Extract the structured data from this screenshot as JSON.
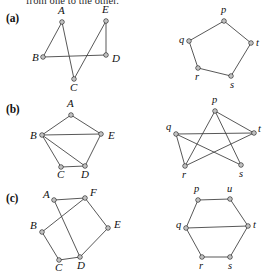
{
  "document": {
    "clipped_text": "from one to the other.",
    "panels": [
      {
        "id": "a",
        "label": "(a)"
      },
      {
        "id": "b",
        "label": "(b)"
      },
      {
        "id": "c",
        "label": "(c)"
      }
    ]
  },
  "figure": {
    "node_style": "open-circle",
    "edge_color": "#3a3a3a",
    "node_fill": "#ffffff",
    "node_stroke": "#2b2b2b",
    "graphs": [
      {
        "panel": "a",
        "side": "left",
        "name": "graph-a-left",
        "vertices": [
          {
            "id": "A",
            "label": "A",
            "x": 62,
            "y": 22,
            "lx": 58,
            "ly": 14
          },
          {
            "id": "E",
            "label": "E",
            "x": 106,
            "y": 21,
            "lx": 102,
            "ly": 13
          },
          {
            "id": "B",
            "label": "B",
            "x": 43,
            "y": 57,
            "lx": 32,
            "ly": 61
          },
          {
            "id": "D",
            "label": "D",
            "x": 106,
            "y": 55,
            "lx": 112,
            "ly": 62
          },
          {
            "id": "C",
            "label": "C",
            "x": 74,
            "y": 79,
            "lx": 70,
            "ly": 91
          }
        ],
        "edges": [
          [
            "A",
            "B"
          ],
          [
            "A",
            "C"
          ],
          [
            "B",
            "D"
          ],
          [
            "C",
            "E"
          ],
          [
            "E",
            "D"
          ]
        ]
      },
      {
        "panel": "a",
        "side": "right",
        "name": "graph-a-right",
        "vertices": [
          {
            "id": "p",
            "label": "p",
            "x": 224,
            "y": 21,
            "lx": 221,
            "ly": 13
          },
          {
            "id": "q",
            "label": "q",
            "x": 189,
            "y": 41,
            "lx": 179,
            "ly": 43
          },
          {
            "id": "t",
            "label": "t",
            "x": 251,
            "y": 43,
            "lx": 256,
            "ly": 46
          },
          {
            "id": "r",
            "label": "r",
            "x": 198,
            "y": 68,
            "lx": 195,
            "ly": 80
          },
          {
            "id": "s",
            "label": "s",
            "x": 231,
            "y": 76,
            "lx": 230,
            "ly": 88
          }
        ],
        "edges": [
          [
            "p",
            "q"
          ],
          [
            "q",
            "r"
          ],
          [
            "r",
            "s"
          ],
          [
            "s",
            "t"
          ],
          [
            "t",
            "p"
          ]
        ]
      },
      {
        "panel": "b",
        "side": "left",
        "name": "graph-b-left",
        "vertices": [
          {
            "id": "A",
            "label": "A",
            "x": 71,
            "y": 115,
            "lx": 67,
            "ly": 107
          },
          {
            "id": "B",
            "label": "B",
            "x": 42,
            "y": 135,
            "lx": 30,
            "ly": 139
          },
          {
            "id": "E",
            "label": "E",
            "x": 101,
            "y": 134,
            "lx": 108,
            "ly": 139
          },
          {
            "id": "C",
            "label": "C",
            "x": 61,
            "y": 167,
            "lx": 57,
            "ly": 178
          },
          {
            "id": "D",
            "label": "D",
            "x": 85,
            "y": 166,
            "lx": 81,
            "ly": 178
          }
        ],
        "edges": [
          [
            "A",
            "B"
          ],
          [
            "A",
            "E"
          ],
          [
            "B",
            "E"
          ],
          [
            "B",
            "C"
          ],
          [
            "B",
            "D"
          ],
          [
            "C",
            "D"
          ],
          [
            "D",
            "E"
          ]
        ]
      },
      {
        "panel": "b",
        "side": "right",
        "name": "graph-b-right",
        "vertices": [
          {
            "id": "p",
            "label": "p",
            "x": 215,
            "y": 111,
            "lx": 212,
            "ly": 103
          },
          {
            "id": "q",
            "label": "q",
            "x": 176,
            "y": 134,
            "lx": 166,
            "ly": 130
          },
          {
            "id": "t",
            "label": "t",
            "x": 254,
            "y": 133,
            "lx": 258,
            "ly": 132
          },
          {
            "id": "r",
            "label": "r",
            "x": 185,
            "y": 166,
            "lx": 182,
            "ly": 178
          },
          {
            "id": "s",
            "label": "s",
            "x": 241,
            "y": 165,
            "lx": 239,
            "ly": 177
          }
        ],
        "edges": [
          [
            "p",
            "t"
          ],
          [
            "p",
            "r"
          ],
          [
            "p",
            "s"
          ],
          [
            "q",
            "t"
          ],
          [
            "q",
            "r"
          ],
          [
            "q",
            "s"
          ],
          [
            "r",
            "t"
          ]
        ]
      },
      {
        "panel": "c",
        "side": "left",
        "name": "graph-c-left",
        "vertices": [
          {
            "id": "A",
            "label": "A",
            "x": 54,
            "y": 200,
            "lx": 43,
            "ly": 198
          },
          {
            "id": "F",
            "label": "F",
            "x": 85,
            "y": 198,
            "lx": 90,
            "ly": 196
          },
          {
            "id": "B",
            "label": "B",
            "x": 42,
            "y": 232,
            "lx": 30,
            "ly": 229
          },
          {
            "id": "E",
            "label": "E",
            "x": 108,
            "y": 228,
            "lx": 114,
            "ly": 228
          },
          {
            "id": "C",
            "label": "C",
            "x": 59,
            "y": 260,
            "lx": 55,
            "ly": 271
          },
          {
            "id": "D",
            "label": "D",
            "x": 80,
            "y": 257,
            "lx": 77,
            "ly": 269
          }
        ],
        "edges": [
          [
            "A",
            "F"
          ],
          [
            "A",
            "D"
          ],
          [
            "B",
            "F"
          ],
          [
            "B",
            "C"
          ],
          [
            "C",
            "D"
          ],
          [
            "D",
            "E"
          ],
          [
            "E",
            "F"
          ]
        ]
      },
      {
        "panel": "c",
        "side": "right",
        "name": "graph-c-right",
        "vertices": [
          {
            "id": "p",
            "label": "p",
            "x": 198,
            "y": 200,
            "lx": 194,
            "ly": 192
          },
          {
            "id": "u",
            "label": "u",
            "x": 230,
            "y": 199,
            "lx": 227,
            "ly": 192
          },
          {
            "id": "q",
            "label": "q",
            "x": 186,
            "y": 228,
            "lx": 176,
            "ly": 228
          },
          {
            "id": "t",
            "label": "t",
            "x": 248,
            "y": 226,
            "lx": 253,
            "ly": 228
          },
          {
            "id": "r",
            "label": "r",
            "x": 202,
            "y": 257,
            "lx": 199,
            "ly": 269
          },
          {
            "id": "s",
            "label": "s",
            "x": 230,
            "y": 257,
            "lx": 228,
            "ly": 269
          }
        ],
        "edges": [
          [
            "p",
            "u"
          ],
          [
            "p",
            "q"
          ],
          [
            "u",
            "t"
          ],
          [
            "q",
            "r"
          ],
          [
            "q",
            "t"
          ],
          [
            "r",
            "s"
          ],
          [
            "s",
            "t"
          ]
        ]
      }
    ]
  }
}
